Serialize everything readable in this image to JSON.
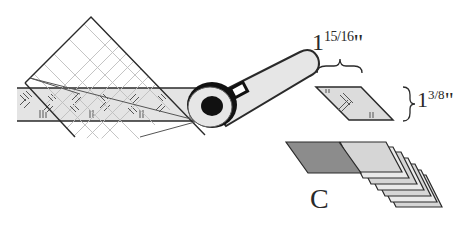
{
  "figure": {
    "width_label": {
      "whole": "1",
      "fraction": "15/16",
      "unit": "\""
    },
    "height_label": {
      "whole": "1",
      "fraction": "3/8",
      "unit": "\""
    },
    "step_label": "C",
    "colors": {
      "line": "#2a2a2a",
      "strip_fill": "#e4e4e4",
      "grid": "#bdbdbd",
      "stack_dark": "#8c8c8c",
      "stack_light": "#d6d6d6",
      "cutter_body": "#e6e6e6",
      "cutter_hub": "#111111"
    }
  }
}
